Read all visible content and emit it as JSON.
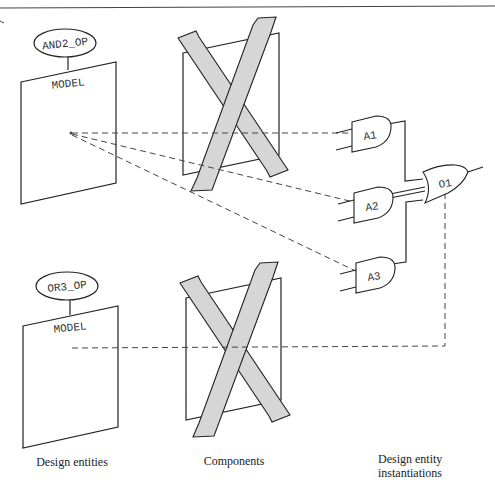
{
  "diagram": {
    "entities": [
      {
        "name": "AND2_OP",
        "body_label": "MODEL"
      },
      {
        "name": "OR3_OP",
        "body_label": "MODEL"
      }
    ],
    "instances": {
      "and_gates": [
        "A1",
        "A2",
        "A3"
      ],
      "or_gate": "O1"
    },
    "captions": {
      "design_entities": "Design entities",
      "components": "Components",
      "instantiations_line1": "Design entity",
      "instantiations_line2": "instantiations"
    },
    "colors": {
      "ribbon_fill": "#d6d6d6",
      "line": "#222222",
      "background": "#ffffff"
    }
  }
}
